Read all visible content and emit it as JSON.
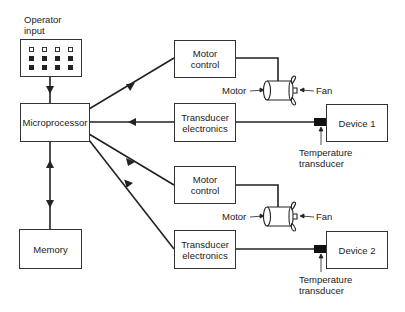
{
  "diagram": {
    "nodes": {
      "operator_input": {
        "label": "Operator input",
        "keypad": {
          "rows": 3,
          "cols": 4,
          "open_rows": 1
        }
      },
      "microprocessor": {
        "label": "Microprocessor"
      },
      "memory": {
        "label": "Memory"
      },
      "motor_control_1": {
        "label": "Motor control"
      },
      "transducer_electronics_1": {
        "label": "Transducer electronics"
      },
      "device_1": {
        "label": "Device 1"
      },
      "motor_control_2": {
        "label": "Motor control"
      },
      "transducer_electronics_2": {
        "label": "Transducer electronics"
      },
      "device_2": {
        "label": "Device 2"
      }
    },
    "annotations": {
      "motor_1": "Motor",
      "fan_1": "Fan",
      "temp_1": "Temperature transducer",
      "motor_2": "Motor",
      "fan_2": "Fan",
      "temp_2": "Temperature transducer"
    },
    "edges": [
      {
        "from": "operator_input",
        "to": "microprocessor",
        "arrow": "to"
      },
      {
        "from": "microprocessor",
        "to": "memory",
        "arrow": "both"
      },
      {
        "from": "microprocessor",
        "to": "motor_control_1",
        "arrow": "to"
      },
      {
        "from": "transducer_electronics_1",
        "to": "microprocessor",
        "arrow": "to"
      },
      {
        "from": "microprocessor",
        "to": "motor_control_2",
        "arrow": "to"
      },
      {
        "from": "transducer_electronics_2",
        "to": "microprocessor",
        "arrow": "to"
      },
      {
        "from": "motor_control_1",
        "to": "motor_1",
        "arrow": "none"
      },
      {
        "from": "device_1",
        "to": "transducer_electronics_1",
        "arrow": "none"
      },
      {
        "from": "motor_control_2",
        "to": "motor_2",
        "arrow": "none"
      },
      {
        "from": "device_2",
        "to": "transducer_electronics_2",
        "arrow": "none"
      }
    ]
  },
  "labels": {
    "operator_line1": "Operator",
    "operator_line2": "input",
    "microprocessor": "Microprocessor",
    "memory": "Memory",
    "motor_control_line1": "Motor",
    "motor_control_line2": "control",
    "transducer_line1": "Transducer",
    "transducer_line2": "electronics",
    "device_1": "Device 1",
    "device_2": "Device 2",
    "motor": "Motor",
    "fan": "Fan",
    "temp_line1": "Temperature",
    "temp_line2": "transducer"
  }
}
